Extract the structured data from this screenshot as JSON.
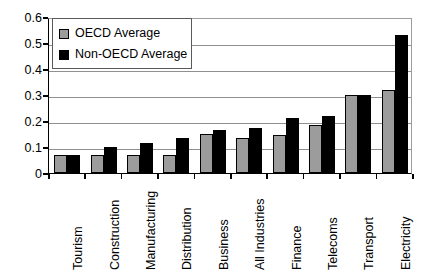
{
  "chart_data": {
    "type": "bar",
    "title": "",
    "subtitle": "",
    "xlabel": "",
    "ylabel": "",
    "ylim": [
      0,
      0.6
    ],
    "ytick_labels": [
      "0",
      "0.1",
      "0.2",
      "0.3",
      "0.4",
      "0.5",
      "0.6"
    ],
    "ytick_values": [
      0,
      0.1,
      0.2,
      0.3,
      0.4,
      0.5,
      0.6
    ],
    "grid": true,
    "grid_axis": "y",
    "legend_position": "upper-left-inside",
    "categories": [
      "Tourism",
      "Construction",
      "Manufacturing",
      "Distribution",
      "Business",
      "All Industries",
      "Finance",
      "Telecoms",
      "Transport",
      "Electricity"
    ],
    "series": [
      {
        "name": "OECD Average",
        "color": "#9c9c9c",
        "values": [
          0.07,
          0.07,
          0.07,
          0.07,
          0.15,
          0.135,
          0.145,
          0.185,
          0.3,
          0.32
        ]
      },
      {
        "name": "Non-OECD Average",
        "color": "#000000",
        "values": [
          0.07,
          0.1,
          0.115,
          0.135,
          0.165,
          0.175,
          0.21,
          0.22,
          0.3,
          0.53
        ]
      }
    ]
  },
  "legend": {
    "entries": [
      {
        "label": "OECD Average",
        "swatch": "oecd"
      },
      {
        "label": "Non-OECD Average",
        "swatch": "nonoecd"
      }
    ]
  }
}
